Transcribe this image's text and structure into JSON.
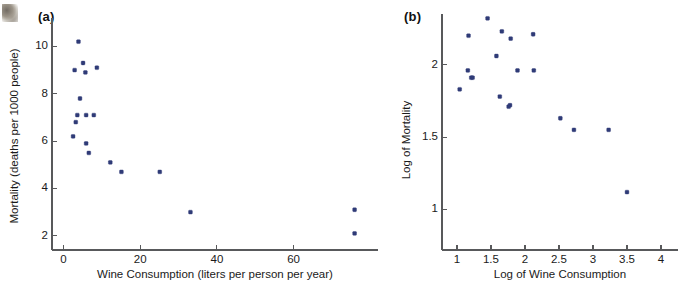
{
  "figure": {
    "decoration": "thumb-smudge"
  },
  "panels": [
    {
      "label": "(a)",
      "chart_index": 0
    },
    {
      "label": "(b)",
      "chart_index": 1
    }
  ],
  "chart_data": [
    {
      "type": "scatter",
      "title": "(a)",
      "xlabel": "Wine Consumption (liters per person per year)",
      "ylabel": "Mortality (deaths per 1000 people)",
      "xlim": [
        -3,
        82
      ],
      "ylim": [
        1.4,
        11.2
      ],
      "xticks": [
        0,
        20,
        40,
        60
      ],
      "yticks": [
        2,
        4,
        6,
        8,
        10
      ],
      "xticklabels": [
        "0",
        "20",
        "40",
        "60"
      ],
      "yticklabels": [
        "2",
        "4",
        "6",
        "8",
        "10"
      ],
      "grid": false,
      "legend": false,
      "marker_color": "#2f3b77",
      "x": [
        2.5,
        3.9,
        2.9,
        3.2,
        5.1,
        5.7,
        5.9,
        5.9,
        6.6,
        7.9,
        8.7,
        12.2,
        15.1,
        25.1,
        33.1,
        75.9,
        75.9,
        3.6,
        4.3
      ],
      "y": [
        6.2,
        10.2,
        9.0,
        6.8,
        9.3,
        8.9,
        7.1,
        5.9,
        5.5,
        7.1,
        9.1,
        5.1,
        4.7,
        4.7,
        3.0,
        3.1,
        2.1,
        7.1,
        7.8
      ]
    },
    {
      "type": "scatter",
      "title": "(b)",
      "xlabel": "Log of Wine Consumption",
      "ylabel": "Log of Mortality",
      "xlim": [
        0.78,
        4.25
      ],
      "ylim": [
        0.72,
        2.35
      ],
      "xticks": [
        1,
        1.5,
        2,
        2.5,
        3,
        3.5,
        4
      ],
      "yticks": [
        1,
        1.5,
        2
      ],
      "xticklabels": [
        "1",
        "1.5",
        "2",
        "2.5",
        "3",
        "3.5",
        "4"
      ],
      "yticklabels": [
        "1",
        "1.5",
        "2"
      ],
      "grid": false,
      "legend": false,
      "marker_color": "#2f3b77",
      "x": [
        1.04,
        1.45,
        1.17,
        1.21,
        1.58,
        1.66,
        1.79,
        1.78,
        1.89,
        2.12,
        2.13,
        2.52,
        2.72,
        3.23,
        3.5,
        1.16,
        1.23,
        1.63,
        1.76
      ],
      "y": [
        1.83,
        2.32,
        2.2,
        1.91,
        2.06,
        2.23,
        2.18,
        1.72,
        1.96,
        2.21,
        1.96,
        1.63,
        1.55,
        1.55,
        1.12,
        1.96,
        1.91,
        1.78,
        1.71
      ]
    }
  ]
}
